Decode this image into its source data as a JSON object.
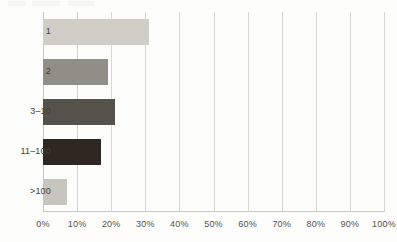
{
  "chart_data": {
    "type": "bar",
    "orientation": "horizontal",
    "title": "",
    "subtitle": "",
    "xlabel": "",
    "ylabel": "",
    "categories": [
      "1",
      "2",
      "3–10",
      "11–100",
      ">100"
    ],
    "values": [
      31,
      19,
      21,
      17,
      7
    ],
    "value_labels": [
      "31%",
      "19%",
      "21%",
      "17%",
      "7%"
    ],
    "xlim": [
      0,
      100
    ],
    "xtick_values": [
      0,
      10,
      20,
      30,
      40,
      50,
      60,
      70,
      80,
      90,
      100
    ],
    "xtick_labels": [
      "0%",
      "10%",
      "20%",
      "30%",
      "40%",
      "50%",
      "60%",
      "70%",
      "80%",
      "90%",
      "100%"
    ],
    "grid": "vertical",
    "legend": "none",
    "bar_colors": [
      "#cfcfc8",
      "#8f8f88",
      "#55524c",
      "#2e2722",
      "#c6c6bf"
    ],
    "series": [
      {
        "name": "share",
        "values": [
          31,
          19,
          21,
          17,
          7
        ]
      }
    ]
  },
  "style": {
    "background": "#fdfdfb",
    "gridline_color": "#d8d8d2",
    "axis_color": "#c9c9c2",
    "tick_text_color": "#55514a",
    "category_text_color": "#444039"
  }
}
